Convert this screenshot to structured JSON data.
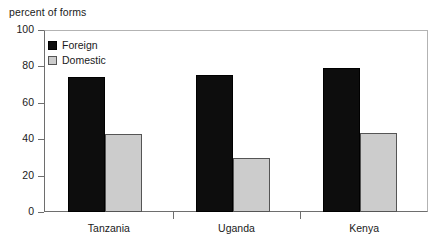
{
  "chart_data": {
    "type": "bar",
    "title": "percent of forms",
    "xlabel": "",
    "ylabel": "",
    "ylim": [
      0,
      100
    ],
    "yticks": [
      0,
      20,
      40,
      60,
      80,
      100
    ],
    "grid": false,
    "legend_position": "top-left",
    "categories": [
      "Tanzania",
      "Uganda",
      "Kenya"
    ],
    "series": [
      {
        "name": "Foreign",
        "color": "#0d0d0d",
        "values": [
          74,
          75.5,
          79
        ]
      },
      {
        "name": "Domestic",
        "color": "#cccccc",
        "values": [
          43,
          29.5,
          43.5
        ]
      }
    ]
  }
}
